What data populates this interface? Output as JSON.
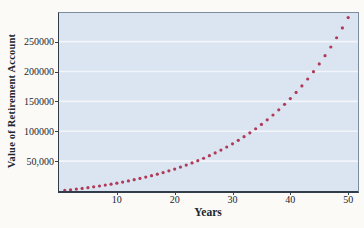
{
  "chart_data": {
    "type": "scatter",
    "title": "",
    "xlabel": "Years",
    "ylabel": "Value of Retirement Account",
    "series_name": "Value of retirement account by year",
    "x": [
      1,
      2,
      3,
      4,
      5,
      6,
      7,
      8,
      9,
      10,
      11,
      12,
      13,
      14,
      15,
      16,
      17,
      18,
      19,
      20,
      21,
      22,
      23,
      24,
      25,
      26,
      27,
      28,
      29,
      30,
      31,
      32,
      33,
      34,
      35,
      36,
      37,
      38,
      39,
      40,
      41,
      42,
      43,
      44,
      45,
      46,
      47,
      48,
      49,
      50
    ],
    "y": [
      1000,
      2060,
      3184,
      4375,
      5637,
      6975,
      8394,
      9897,
      11491,
      13181,
      14972,
      16870,
      18882,
      21015,
      23276,
      25673,
      28213,
      30906,
      33760,
      36786,
      39993,
      43392,
      46996,
      50816,
      54865,
      59156,
      63706,
      68528,
      73640,
      79058,
      84802,
      90890,
      97343,
      104184,
      111435,
      119121,
      127268,
      135904,
      145058,
      154762,
      165048,
      175951,
      187508,
      199758,
      212744,
      226508,
      241099,
      256565,
      272958,
      290336
    ],
    "xlim": [
      0,
      51.7
    ],
    "ylim": [
      0,
      298000
    ],
    "x_ticks": [
      {
        "v": 10,
        "label": "10"
      },
      {
        "v": 20,
        "label": "20"
      },
      {
        "v": 30,
        "label": "30"
      },
      {
        "v": 40,
        "label": "40"
      },
      {
        "v": 50,
        "label": "50"
      }
    ],
    "y_ticks": [
      {
        "v": 50000,
        "label": "50,000"
      },
      {
        "v": 100000,
        "label": "100000"
      },
      {
        "v": 150000,
        "label": "150000"
      },
      {
        "v": 200000,
        "label": "200000"
      },
      {
        "v": 250000,
        "label": "250000"
      }
    ],
    "grid": "horizontal gridlines at y ticks",
    "legend": "none",
    "colors": {
      "page_bg": "#fbfaf6",
      "plot_bg": "#dae5f1",
      "gridline": "#f2f6fa",
      "point": "#b03a58",
      "frame_light": "#7d8da0",
      "axis": "#333d49",
      "text": "#20262e"
    }
  }
}
